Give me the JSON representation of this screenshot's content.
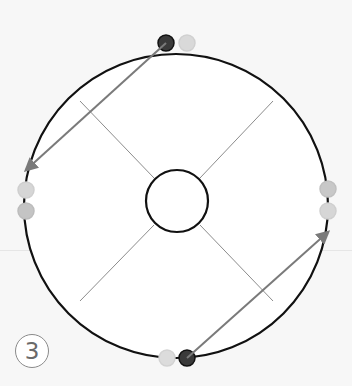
{
  "diagram": {
    "step_label": "3",
    "outer_circle": {
      "cx": 176,
      "cy": 206,
      "r": 152,
      "stroke": "#111111"
    },
    "inner_circle": {
      "cx": 177,
      "cy": 201,
      "r": 31,
      "stroke": "#111111"
    },
    "spokes": [
      {
        "x1": 80,
        "y1": 101,
        "x2": 154,
        "y2": 178
      },
      {
        "x1": 273,
        "y1": 101,
        "x2": 200,
        "y2": 178
      },
      {
        "x1": 80,
        "y1": 301,
        "x2": 154,
        "y2": 225
      },
      {
        "x1": 273,
        "y1": 301,
        "x2": 200,
        "y2": 225
      }
    ],
    "markers": [
      {
        "id": "top-dark",
        "cx": 166,
        "cy": 43,
        "r": 8,
        "fill": "#3a3a3a",
        "stroke": "#111111"
      },
      {
        "id": "top-light",
        "cx": 187,
        "cy": 43,
        "r": 8,
        "fill": "#d9d9d9",
        "stroke": "#d0d0d0"
      },
      {
        "id": "left-1",
        "cx": 26,
        "cy": 190,
        "r": 8,
        "fill": "#d6d6d6",
        "stroke": "#cfcfcf"
      },
      {
        "id": "left-2",
        "cx": 26,
        "cy": 211,
        "r": 8,
        "fill": "#c4c4c4",
        "stroke": "#bcbcbc"
      },
      {
        "id": "right-1",
        "cx": 328,
        "cy": 189,
        "r": 8,
        "fill": "#c8c8c8",
        "stroke": "#c0c0c0"
      },
      {
        "id": "right-2",
        "cx": 328,
        "cy": 211,
        "r": 8,
        "fill": "#d6d6d6",
        "stroke": "#cfcfcf"
      },
      {
        "id": "bottom-light",
        "cx": 167,
        "cy": 358,
        "r": 8,
        "fill": "#dcdcdc",
        "stroke": "#d2d2d2"
      },
      {
        "id": "bottom-dark",
        "cx": 187,
        "cy": 358,
        "r": 8,
        "fill": "#3a3a3a",
        "stroke": "#111111"
      }
    ],
    "arrows": [
      {
        "id": "arrow-top-to-left",
        "x1": 166,
        "y1": 43,
        "x2": 26,
        "y2": 170,
        "color": "#7a7a7a"
      },
      {
        "id": "arrow-bottom-to-right",
        "x1": 187,
        "y1": 358,
        "x2": 328,
        "y2": 232,
        "color": "#7a7a7a"
      }
    ]
  }
}
